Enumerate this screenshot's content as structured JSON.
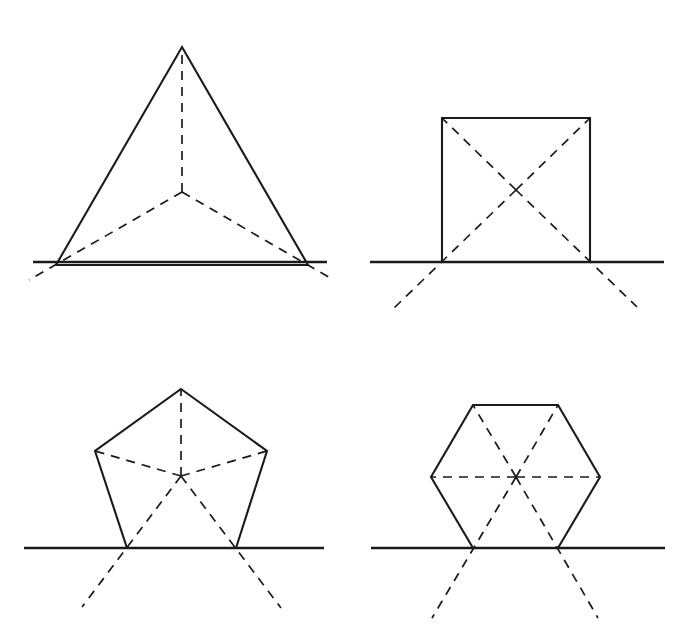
{
  "figure": {
    "background_color": "#ffffff",
    "stroke_color": "#1a1a1a",
    "canvas": {
      "width": 685,
      "height": 633
    }
  },
  "style": {
    "solid_label": "solid outline",
    "dashed_label": "dashed radius",
    "baseline_label": "baseline",
    "solid_width": 2.1,
    "dashed_width": 1.7,
    "baseline_width": 2.6,
    "dash_pattern": "9 7"
  },
  "chart_data": {
    "type": "diagram",
    "panels": [
      {
        "name": "triangle",
        "sides": 3,
        "label": "Equilateral triangle",
        "center": [
          182,
          192
        ],
        "circumradius": 145,
        "rotation_deg": -90,
        "vertices": [
          [
            182,
            47
          ],
          [
            308,
            265
          ],
          [
            56,
            265
          ]
        ],
        "baseline": {
          "x1": 33,
          "x2": 327,
          "y": 262
        },
        "radii": [
          {
            "from": [
              182,
              192
            ],
            "to": [
              182,
              47
            ],
            "extended_to": [
              182,
              47
            ]
          },
          {
            "from": [
              182,
              192
            ],
            "to": [
              308,
              265
            ],
            "extended_to": [
              332,
              279
            ]
          },
          {
            "from": [
              182,
              192
            ],
            "to": [
              56,
              265
            ],
            "extended_to": [
              29,
              280
            ]
          }
        ]
      },
      {
        "name": "square",
        "sides": 4,
        "label": "Square",
        "center": [
          516,
          190
        ],
        "circumradius": 104,
        "rotation_deg": -135,
        "vertices": [
          [
            442,
            118
          ],
          [
            590,
            118
          ],
          [
            590,
            262
          ],
          [
            442,
            262
          ]
        ],
        "baseline": {
          "x1": 370,
          "x2": 664,
          "y": 262
        },
        "radii": [
          {
            "from": [
              516,
              190
            ],
            "to": [
              442,
              118
            ],
            "extended_to": [
              442,
              118
            ]
          },
          {
            "from": [
              516,
              190
            ],
            "to": [
              590,
              118
            ],
            "extended_to": [
              590,
              118
            ]
          },
          {
            "from": [
              516,
              190
            ],
            "to": [
              590,
              262
            ],
            "extended_to": [
              637,
              307
            ]
          },
          {
            "from": [
              516,
              190
            ],
            "to": [
              442,
              262
            ],
            "extended_to": [
              394,
              308
            ]
          }
        ]
      },
      {
        "name": "pentagon",
        "sides": 5,
        "label": "Regular pentagon",
        "center": [
          181,
          476
        ],
        "circumradius": 88,
        "rotation_deg": -90,
        "vertices": [
          [
            181,
            389
          ],
          [
            267,
            451
          ],
          [
            236,
            548
          ],
          [
            127,
            548
          ],
          [
            95,
            451
          ]
        ],
        "baseline": {
          "x1": 24,
          "x2": 324,
          "y": 548
        },
        "radii": [
          {
            "from": [
              181,
              476
            ],
            "to": [
              181,
              389
            ],
            "extended_to": [
              181,
              389
            ]
          },
          {
            "from": [
              181,
              476
            ],
            "to": [
              267,
              451
            ],
            "extended_to": [
              267,
              451
            ]
          },
          {
            "from": [
              181,
              476
            ],
            "to": [
              236,
              548
            ],
            "extended_to": [
              281,
              608
            ]
          },
          {
            "from": [
              181,
              476
            ],
            "to": [
              127,
              548
            ],
            "extended_to": [
              82,
              607
            ]
          },
          {
            "from": [
              181,
              476
            ],
            "to": [
              95,
              451
            ],
            "extended_to": [
              95,
              451
            ]
          }
        ]
      },
      {
        "name": "hexagon",
        "sides": 6,
        "label": "Regular hexagon",
        "center": [
          516,
          477
        ],
        "circumradius": 85,
        "rotation_deg": -120,
        "vertices": [
          [
            473,
            405
          ],
          [
            558,
            405
          ],
          [
            600,
            477
          ],
          [
            558,
            548
          ],
          [
            473,
            548
          ],
          [
            431,
            477
          ]
        ],
        "baseline": {
          "x1": 371,
          "x2": 665,
          "y": 548
        },
        "radii": [
          {
            "from": [
              516,
              477
            ],
            "to": [
              473,
              405
            ],
            "extended_to": [
              473,
              405
            ]
          },
          {
            "from": [
              516,
              477
            ],
            "to": [
              558,
              405
            ],
            "extended_to": [
              558,
              405
            ]
          },
          {
            "from": [
              516,
              477
            ],
            "to": [
              600,
              477
            ],
            "extended_to": [
              600,
              477
            ]
          },
          {
            "from": [
              516,
              477
            ],
            "to": [
              558,
              548
            ],
            "extended_to": [
              598,
              618
            ]
          },
          {
            "from": [
              516,
              477
            ],
            "to": [
              473,
              548
            ],
            "extended_to": [
              432,
              618
            ]
          },
          {
            "from": [
              516,
              477
            ],
            "to": [
              431,
              477
            ],
            "extended_to": [
              431,
              477
            ]
          }
        ]
      }
    ]
  }
}
